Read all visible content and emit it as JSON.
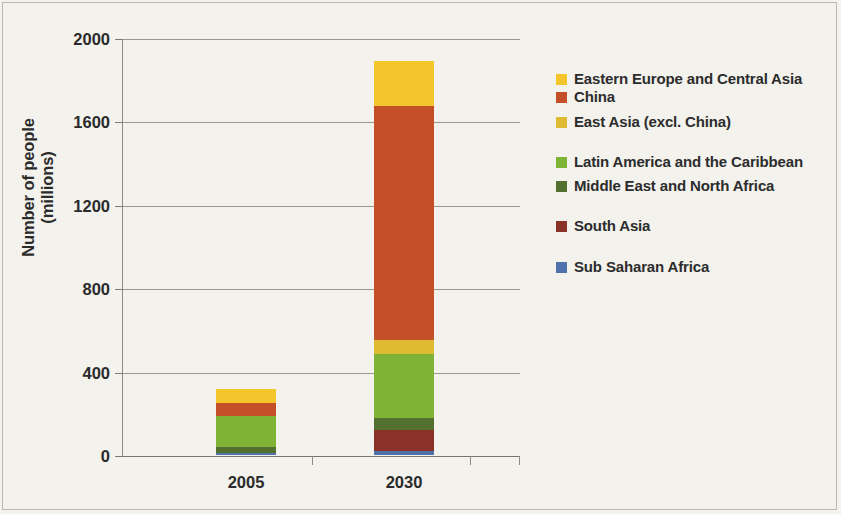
{
  "chart_data": {
    "type": "bar",
    "subtype": "stacked-vertical",
    "title": "",
    "xlabel": "",
    "ylabel": "Number of people (millions)",
    "categories": [
      "2005",
      "2030"
    ],
    "xtick_labels": [
      "2005",
      "2030"
    ],
    "ytick_labels": [
      "0",
      "400",
      "800",
      "1200",
      "1600",
      "2000"
    ],
    "ylim": [
      0,
      2000
    ],
    "ytick_values": [
      0,
      400,
      800,
      1200,
      1600,
      2000
    ],
    "grid": "horizontal",
    "legend_position": "right",
    "stack_order_bottom_to_top": [
      "Sub Saharan Africa",
      "South Asia",
      "Middle East and North Africa",
      "Latin America and the Caribbean",
      "East Asia (excl. China)",
      "China",
      "Eastern Europe and Central Asia"
    ],
    "series": [
      {
        "name": "Sub Saharan Africa",
        "color": "#4f72ad",
        "values": [
          12,
          20
        ]
      },
      {
        "name": "South Asia",
        "color": "#8b3228",
        "values": [
          0,
          100
        ]
      },
      {
        "name": "Middle East and North Africa",
        "color": "#53702f",
        "values": [
          26,
          58
        ]
      },
      {
        "name": "Latin America and the Caribbean",
        "color": "#7fb336",
        "values": [
          149,
          307
        ]
      },
      {
        "name": "East Asia (excl. China)",
        "color": "#dfba33",
        "values": [
          0,
          67
        ]
      },
      {
        "name": "China",
        "color": "#c4502a",
        "values": [
          63,
          1123
        ]
      },
      {
        "name": "Eastern Europe and Central Asia",
        "color": "#f4c62c",
        "values": [
          65,
          215
        ]
      }
    ],
    "totals": [
      315,
      1890
    ],
    "annotations": []
  },
  "legend": {
    "items": [
      {
        "label": "Eastern Europe and Central Asia",
        "color": "#f4c62c"
      },
      {
        "label": "China",
        "color": "#c4502a"
      },
      {
        "label": "East Asia (excl. China)",
        "color": "#dfba33"
      },
      {
        "label": "Latin America and the Caribbean",
        "color": "#7fb336"
      },
      {
        "label": "Middle East and North Africa",
        "color": "#53702f"
      },
      {
        "label": "South Asia",
        "color": "#8b3228"
      },
      {
        "label": "Sub Saharan Africa",
        "color": "#4f72ad"
      }
    ]
  },
  "axis": {
    "y_title": "Number of people\n(millions)",
    "y_title_line1": "Number of people",
    "y_title_line2": "(millions)"
  },
  "colors": {
    "background": "#f3f2ed",
    "gridline": "#9a988f",
    "axis": "#8d8b83",
    "text": "#2b2b2b",
    "frame": "#b9b7ae"
  }
}
